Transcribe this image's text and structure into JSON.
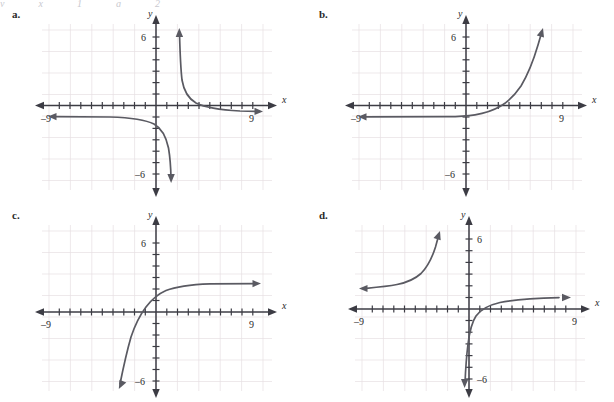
{
  "page": {
    "top_artifact_fragments": [
      "y",
      "x",
      "1",
      "g",
      "2"
    ],
    "background_color": "#ffffff",
    "grid_color": "#e6dfe2",
    "axis_color": "#3c3c44",
    "curve_color": "#5a5a62"
  },
  "panels": [
    {
      "label": "a.",
      "axis_x_name": "x",
      "axis_y_name": "y",
      "x_tick_label_left": "–9",
      "x_tick_label_right": "9",
      "y_tick_label_top": "6",
      "y_tick_label_bottom": "–6"
    },
    {
      "label": "b.",
      "axis_x_name": "x",
      "axis_y_name": "y",
      "x_tick_label_left": "–9",
      "x_tick_label_right": "9",
      "y_tick_label_top": "6",
      "y_tick_label_bottom": "–6"
    },
    {
      "label": "c.",
      "axis_x_name": "x",
      "axis_y_name": "y",
      "x_tick_label_left": "–9",
      "x_tick_label_right": "9",
      "y_tick_label_top": "6",
      "y_tick_label_bottom": "–6"
    },
    {
      "label": "d.",
      "axis_x_name": "x",
      "axis_y_name": "y",
      "x_tick_label_left": "–9",
      "x_tick_label_right": "9",
      "y_tick_label_top": "6",
      "y_tick_label_bottom": "–6"
    }
  ],
  "chart_data": [
    {
      "id": "a",
      "type": "line",
      "title": "a.",
      "xlabel": "x",
      "ylabel": "y",
      "xlim": [
        -10,
        10
      ],
      "ylim": [
        -7.5,
        7.5
      ],
      "xticks": [
        -9,
        9
      ],
      "yticks": [
        -6,
        6
      ],
      "grid": true,
      "description": "Rational / reciprocal function with a vertical asymptote at x = 2 and a horizontal asymptote at y = -1. Upper-right branch falls from +infinity near x = 2 toward y = -1 as x increases; lower-left branch rises from -infinity near x = 2 toward y = -1 as x decreases.",
      "asymptotes": {
        "vertical": [
          2
        ],
        "horizontal": [
          -1
        ]
      },
      "series": [
        {
          "name": "right-branch",
          "x": [
            2.15,
            2.3,
            2.6,
            3.0,
            3.6,
            4.4,
            5.4,
            6.6,
            8.0,
            9.6
          ],
          "y": [
            6.2,
            3.4,
            1.3,
            0.2,
            -0.4,
            -0.7,
            -0.84,
            -0.91,
            -0.95,
            -0.97
          ]
        },
        {
          "name": "left-branch",
          "x": [
            -9.6,
            -8.0,
            -6.2,
            -4.4,
            -3.0,
            -2.0,
            -1.2,
            -0.5,
            0.2,
            0.9,
            1.4,
            1.75,
            1.9
          ],
          "y": [
            -1.03,
            -1.05,
            -1.08,
            -1.13,
            -1.2,
            -1.3,
            -1.42,
            -1.65,
            -2.0,
            -2.7,
            -3.8,
            -5.3,
            -6.4
          ]
        }
      ]
    },
    {
      "id": "b",
      "type": "line",
      "title": "b.",
      "xlabel": "x",
      "ylabel": "y",
      "xlim": [
        -10,
        10
      ],
      "ylim": [
        -7.5,
        7.5
      ],
      "xticks": [
        -9,
        9
      ],
      "yticks": [
        -6,
        6
      ],
      "grid": true,
      "description": "Increasing exponential growth curve with horizontal asymptote y = -1. Passes through about (0, -0.9) and crosses the x-axis near x = 3.3, then rises steeply to y = 6 near x = 7.5.",
      "asymptotes": {
        "vertical": [],
        "horizontal": [
          -1
        ]
      },
      "series": [
        {
          "name": "exponential",
          "x": [
            -9.6,
            -7.0,
            -5.0,
            -3.0,
            -1.5,
            0.0,
            1.2,
            2.2,
            3.0,
            3.8,
            4.6,
            5.4,
            6.2,
            6.9,
            7.4
          ],
          "y": [
            -1.0,
            -1.0,
            -1.0,
            -0.99,
            -0.97,
            -0.92,
            -0.85,
            -0.7,
            -0.45,
            -0.05,
            0.6,
            1.5,
            2.8,
            4.4,
            6.3
          ]
        }
      ]
    },
    {
      "id": "c",
      "type": "line",
      "title": "c.",
      "xlabel": "x",
      "ylabel": "y",
      "xlim": [
        -10,
        10
      ],
      "ylim": [
        -7.5,
        7.5
      ],
      "xticks": [
        -9,
        9
      ],
      "yticks": [
        -6,
        6
      ],
      "grid": true,
      "description": "Reflected/decaying exponential rising from lower-left to a horizontal asymptote at y = 3. Crosses the x-axis near x = -1.2, passes through about (0, 2), and flattens toward y = 3 for large x.",
      "asymptotes": {
        "vertical": [],
        "horizontal": [
          3
        ]
      },
      "series": [
        {
          "name": "exponential",
          "x": [
            -2.6,
            -2.3,
            -2.0,
            -1.7,
            -1.4,
            -1.0,
            -0.5,
            0.0,
            0.7,
            1.5,
            2.5,
            3.6,
            5.0,
            6.5,
            8.0,
            9.6
          ],
          "y": [
            -6.3,
            -4.6,
            -3.1,
            -1.9,
            -0.9,
            0.3,
            1.3,
            2.0,
            2.5,
            2.78,
            2.9,
            2.96,
            2.99,
            3.0,
            3.0,
            3.0
          ]
        }
      ]
    },
    {
      "id": "d",
      "type": "line",
      "title": "d.",
      "xlabel": "x",
      "ylabel": "y",
      "xlim": [
        -10,
        10
      ],
      "ylim": [
        -7.5,
        7.5
      ],
      "xticks": [
        -9,
        9
      ],
      "yticks": [
        -6,
        6
      ],
      "grid": true,
      "description": "Two separate branches. Upper-left branch rises from a horizontal asymptote near y = 2 on the far left up to about (-2.3, 6.3). Lower-right branch is a logarithm-shaped curve rising steeply from below y = -6 near x = -0.4, crossing the x-axis around x = 0.6, and flattening toward y = 1 as x approaches 9.",
      "asymptotes": {
        "vertical": [
          -0.4
        ],
        "horizontal": [
          2,
          1
        ]
      },
      "series": [
        {
          "name": "upper-left-branch",
          "x": [
            -9.4,
            -8.4,
            -7.4,
            -6.4,
            -5.6,
            -4.9,
            -4.3,
            -3.8,
            -3.4,
            -3.0,
            -2.7,
            -2.45,
            -2.3
          ],
          "y": [
            2.0,
            2.05,
            2.15,
            2.3,
            2.5,
            2.75,
            3.05,
            3.45,
            3.9,
            4.5,
            5.2,
            5.9,
            6.35
          ]
        },
        {
          "name": "lower-right-branch",
          "x": [
            -0.35,
            -0.2,
            0.0,
            0.25,
            0.6,
            1.1,
            1.8,
            2.7,
            3.8,
            5.0,
            6.3,
            7.6,
            8.8
          ],
          "y": [
            -6.4,
            -4.0,
            -2.2,
            -1.1,
            -0.3,
            0.2,
            0.5,
            0.7,
            0.82,
            0.9,
            0.95,
            0.98,
            1.0
          ]
        }
      ]
    }
  ]
}
